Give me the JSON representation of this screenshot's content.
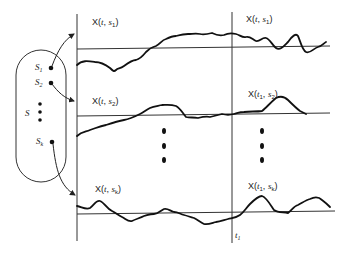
{
  "diagram": {
    "sample_space": {
      "label": "S",
      "outcomes": [
        {
          "label": "S",
          "sub": "1"
        },
        {
          "label": "S",
          "sub": "2"
        },
        {
          "label": "S",
          "sub": "k"
        }
      ],
      "ellipsis": "⋮"
    },
    "rows": [
      {
        "left_label": {
          "prefix": "X(",
          "var": "t",
          "sep": ", ",
          "s": "s",
          "sub": "1",
          "suffix": ")"
        },
        "right_label": {
          "prefix": "X(",
          "var": "t",
          "sep": ", ",
          "s": "s",
          "sub": "1",
          "suffix": ")"
        }
      },
      {
        "left_label": {
          "prefix": "X(",
          "var": "t",
          "sep": ", ",
          "s": "s",
          "sub": "2",
          "suffix": ")"
        },
        "right_label": {
          "prefix": "X(",
          "var": "t",
          "tsub": "1",
          "sep": ", ",
          "s": "s",
          "sub": "2",
          "suffix": ")"
        }
      },
      {
        "left_label": {
          "prefix": "X(",
          "var": "t",
          "sep": ", ",
          "s": "s",
          "sub": "k",
          "suffix": ")"
        },
        "right_label": {
          "prefix": "X(",
          "var": "t",
          "tsub": "1",
          "sep": ", ",
          "s": "s",
          "sub": "k",
          "suffix": ")"
        }
      }
    ],
    "time_marker": {
      "var": "t",
      "sub": "1"
    }
  }
}
